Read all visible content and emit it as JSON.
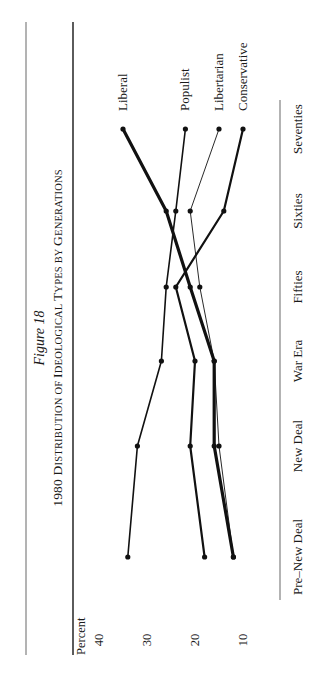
{
  "figure": {
    "label": "Figure 18",
    "title_prefix": "1980 ",
    "title_caps": [
      {
        "big": "D",
        "small": "ISTRIBUTION OF "
      },
      {
        "big": "I",
        "small": "DEOLOGICAL "
      },
      {
        "big": "T",
        "small": "YPES BY "
      },
      {
        "big": "G",
        "small": "ENERATIONS"
      }
    ]
  },
  "chart_data": {
    "type": "line",
    "title": "1980 Distribution of Ideological Types by Generations",
    "subtitle": "Figure 18",
    "xlabel": "",
    "ylabel": "Percent",
    "categories": [
      "Pre–New Deal",
      "New Deal",
      "War Era",
      "Fifties",
      "Sixties",
      "Seventies"
    ],
    "yticks": [
      40,
      30,
      20,
      10
    ],
    "ylim": [
      10,
      40
    ],
    "grid": false,
    "orientation": "rotated 90° counter-clockwise (reads sideways)",
    "legend_position": "direct labels at end of lines (Seventies)",
    "series": [
      {
        "name": "Liberal",
        "values": [
          12,
          16,
          16,
          21,
          26,
          35
        ],
        "stroke_width": 3.2
      },
      {
        "name": "Populist",
        "values": [
          34,
          32,
          27,
          26,
          24,
          22
        ],
        "stroke_width": 1.6
      },
      {
        "name": "Libertarian",
        "values": [
          12,
          15,
          16,
          19,
          21,
          15
        ],
        "stroke_width": 0.9
      },
      {
        "name": "Conservative",
        "values": [
          18,
          21,
          20,
          24,
          14,
          10
        ],
        "stroke_width": 2.2
      }
    ]
  }
}
